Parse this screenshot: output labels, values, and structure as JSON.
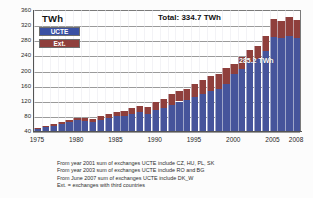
{
  "chart_data": {
    "type": "bar",
    "title": "TWh",
    "subtitle": "Total:  334.7 TWh",
    "xlabel": "",
    "ylabel": "TWh",
    "ylim": [
      40,
      360
    ],
    "grid": true,
    "stacked": true,
    "legend_position": "top-left",
    "yticks": [
      "360",
      "320",
      "280",
      "240",
      "200",
      "160",
      "120",
      "80",
      "40"
    ],
    "ytick_values": [
      360,
      320,
      280,
      240,
      200,
      160,
      120,
      80,
      40
    ],
    "xticks": [
      "1975",
      "1980",
      "1985",
      "1990",
      "1995",
      "2000",
      "2005",
      "2008"
    ],
    "xtick_values": [
      1975,
      1980,
      1985,
      1990,
      1995,
      2000,
      2005,
      2008
    ],
    "categories": [
      1975,
      1976,
      1977,
      1978,
      1979,
      1980,
      1981,
      1982,
      1983,
      1984,
      1985,
      1986,
      1987,
      1988,
      1989,
      1990,
      1991,
      1992,
      1993,
      1994,
      1995,
      1996,
      1997,
      1998,
      1999,
      2000,
      2001,
      2002,
      2003,
      2004,
      2005,
      2006,
      2007,
      2008
    ],
    "series": [
      {
        "name": "UCTE",
        "color": "#46549b",
        "values": [
          46,
          50,
          54,
          58,
          63,
          68,
          66,
          64,
          69,
          75,
          79,
          80,
          85,
          89,
          86,
          95,
          101,
          110,
          118,
          121,
          130,
          139,
          147,
          150,
          163,
          190,
          205,
          222,
          231,
          252,
          288,
          286,
          292,
          285.2
        ]
      },
      {
        "name": "Ext.",
        "color": "#8f3f3c",
        "values": [
          2,
          3,
          4,
          5,
          6,
          7,
          8,
          9,
          10,
          11,
          12,
          14,
          16,
          18,
          18,
          21,
          24,
          27,
          29,
          30,
          33,
          36,
          39,
          41,
          44,
          28,
          30,
          33,
          35,
          38,
          47,
          44,
          50,
          49.5
        ]
      }
    ],
    "totals": [
      48,
      53,
      58,
      63,
      69,
      75,
      74,
      73,
      79,
      86,
      91,
      94,
      101,
      107,
      104,
      116,
      125,
      137,
      147,
      151,
      163,
      175,
      186,
      191,
      207,
      218,
      235,
      255,
      266,
      290,
      335,
      330,
      342,
      334.7
    ],
    "annotations": [
      {
        "text": "285.2 TWh",
        "series": "UCTE",
        "year": 2008
      },
      {
        "text": "Total:  334.7 TWh",
        "position": "top-center"
      }
    ]
  },
  "legend": {
    "items": [
      {
        "label": "UCTE",
        "color": "#3a51a4"
      },
      {
        "label": "Ext.",
        "color": "#8f3f3c"
      }
    ]
  },
  "header": {
    "unit": "TWh",
    "total": "Total:  334.7 TWh"
  },
  "value_label": "285.2 TWh",
  "notes": [
    "From year 2001 sum of exchanges UCTE include CZ, HU, PL, SK",
    "From year 2003 sum of exchanges UCTE include RO and BG",
    "From June 2007 sum of exchanges UCTE include DK_W",
    "Ext. = exchanges with third countries"
  ]
}
